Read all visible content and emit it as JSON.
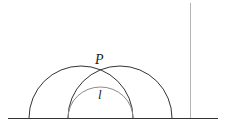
{
  "diagram": {
    "labels": {
      "point": "P",
      "curve": "l"
    },
    "colors": {
      "stroke": "#333333",
      "inner_arc": "#8a8a8a",
      "vertical_line": "#b0b0b0",
      "background": "#ffffff"
    },
    "elements": [
      {
        "type": "baseline",
        "y": 118,
        "x1": 8,
        "x2": 218
      },
      {
        "type": "semicircle",
        "name": "left-arc",
        "cx": 81,
        "r": 52
      },
      {
        "type": "semicircle",
        "name": "right-arc",
        "cx": 120,
        "r": 52
      },
      {
        "type": "semicircle",
        "name": "inner-arc",
        "cx": 100.5,
        "r": 32.5
      },
      {
        "type": "vertical-line",
        "x": 190,
        "y1": 3,
        "y2": 118
      }
    ]
  }
}
